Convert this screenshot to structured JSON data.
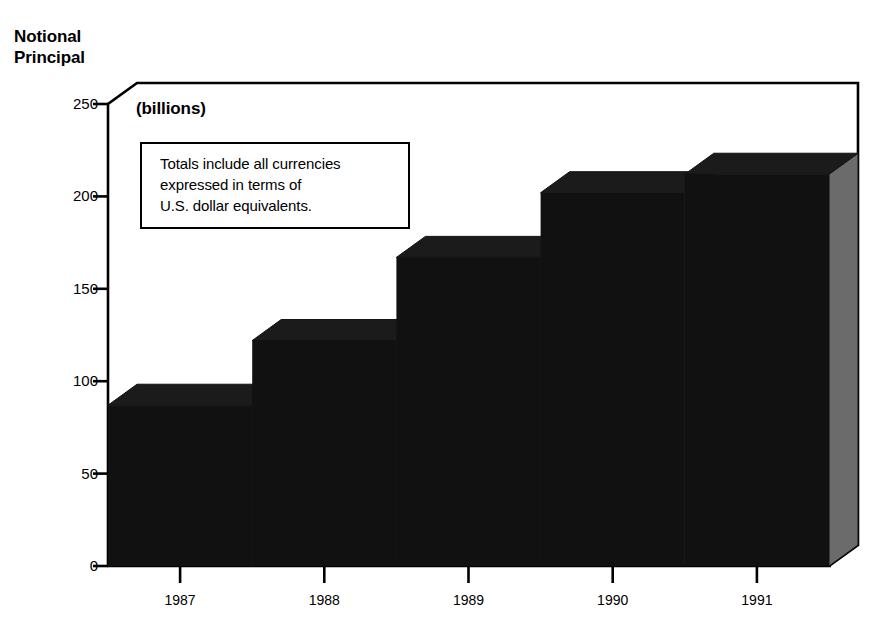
{
  "chart_data": {
    "type": "bar",
    "title": "Notional Principal",
    "title_lines": [
      "Notional",
      "Principal"
    ],
    "units_caption": "(billions)",
    "categories": [
      "1987",
      "1988",
      "1989",
      "1990",
      "1991"
    ],
    "values": [
      87,
      122,
      167,
      202,
      212
    ],
    "xlabel": "",
    "ylabel": "Notional Principal",
    "ylim": [
      0,
      250
    ],
    "yticks": [
      0,
      50,
      100,
      150,
      200,
      250
    ],
    "ytick_labels": [
      "0",
      "50",
      "100",
      "150",
      "200",
      "250"
    ],
    "grid": false,
    "legend": false,
    "style": "3d-column",
    "annotation": {
      "lines": [
        "Totals include all currencies",
        "expressed in terms of",
        "U.S. dollar equivalents."
      ]
    },
    "colors": {
      "bar_front": "#111111",
      "bar_top": "#1b1b1b",
      "bar_side": "#6b6b6b",
      "axis": "#000000",
      "background": "#ffffff",
      "text": "#000000"
    }
  }
}
